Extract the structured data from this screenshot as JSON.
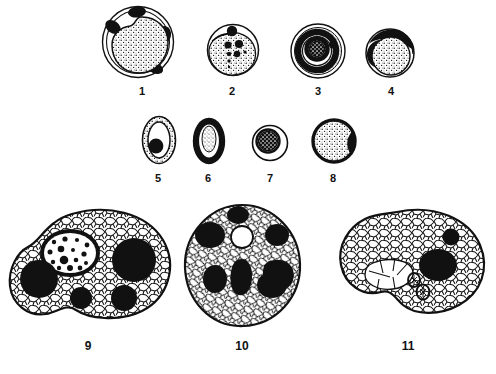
{
  "plate": {
    "background_color": "#ffffff",
    "ink_color": "#000000",
    "width": 496,
    "height": 374,
    "description": "Black and white line-drawing plate of eleven numbered protozoan cyst and trophozoite specimens arranged in three rows",
    "rows": [
      {
        "name": "row-1",
        "figure_numbers": [
          "1",
          "2",
          "3",
          "4"
        ]
      },
      {
        "name": "row-2",
        "figure_numbers": [
          "5",
          "6",
          "7",
          "8"
        ]
      },
      {
        "name": "row-3",
        "figure_numbers": [
          "9",
          "10",
          "11"
        ]
      }
    ]
  },
  "figures": [
    {
      "id": "figure-1",
      "label": "1",
      "row": 1,
      "shape": "large round cyst",
      "outline": "double circular wall",
      "interior": "large stippled rounded mass offset within the wall",
      "inclusions": "four irregular solid black chromatoid patches around the periphery",
      "label_x": 142,
      "label_y": 85
    },
    {
      "id": "figure-2",
      "label": "2",
      "row": 1,
      "shape": "round cyst",
      "outline": "thin circular wall",
      "interior": "stippled granular mass filling most of the cyst",
      "inclusions": "one large black body at top and a cluster of seven graded black dots in the centre",
      "label_x": 232,
      "label_y": 85
    },
    {
      "id": "figure-3",
      "label": "3",
      "row": 1,
      "shape": "round cyst with concentric zones",
      "outline": "thin circular wall",
      "interior": "thick solid black ring enclosing a white ring",
      "inclusions": "dark coarsely stippled central nucleus",
      "label_x": 318,
      "label_y": 85
    },
    {
      "id": "figure-4",
      "label": "4",
      "row": 1,
      "shape": "round cyst",
      "outline": "thin circular wall",
      "interior": "stippled rounded mass filling the lower two thirds",
      "inclusions": "solid black crescent on the upper left and a dark band along the top right",
      "label_x": 391,
      "label_y": 85
    },
    {
      "id": "figure-5",
      "label": "5",
      "row": 2,
      "shape": "oval cyst",
      "outline": "thick stippled oval wall",
      "interior": "clear white oval lumen",
      "inclusions": "one solid black round body set in the lower left of the lumen",
      "label_x": 158,
      "label_y": 173
    },
    {
      "id": "figure-6",
      "label": "6",
      "row": 2,
      "shape": "oval cyst",
      "outline": "thick solid dark oval wall",
      "interior": "pale stippled lens shaped mass",
      "inclusions": "none distinct",
      "label_x": 208,
      "label_y": 173
    },
    {
      "id": "figure-7",
      "label": "7",
      "row": 2,
      "shape": "small round cyst",
      "outline": "thin circular wall",
      "interior": "clear narrow white zone",
      "inclusions": "dark coarsely textured central nucleus",
      "label_x": 270,
      "label_y": 173
    },
    {
      "id": "figure-8",
      "label": "8",
      "row": 2,
      "shape": "round cyst",
      "outline": "thick solid black circular wall",
      "interior": "finely stippled mass",
      "inclusions": "a notch of heavier black at the right edge",
      "label_x": 333,
      "label_y": 173
    },
    {
      "id": "figure-9",
      "label": "9",
      "row": 3,
      "shape": "large irregular amoeboid trophozoite",
      "outline": "lobed pseudopod bearing margin",
      "interior": "coarsely reticulated vacuolated cytoplasm",
      "inclusions": "one ringed nucleus with many chromatin dots, one large black vacuole at right, one black vacuole at left, two smaller black vacuoles below",
      "label_x": 88,
      "label_y": 341
    },
    {
      "id": "figure-10",
      "label": "10",
      "row": 3,
      "shape": "rounded trophozoite",
      "outline": "nearly circular margin",
      "interior": "coarsely reticulated vacuolated cytoplasm",
      "inclusions": "seven solid black ingested bodies of graded size and one clear white vacuole near the top centre",
      "label_x": 242,
      "label_y": 341
    },
    {
      "id": "figure-11",
      "label": "11",
      "row": 3,
      "shape": "large kidney shaped trophozoite",
      "outline": "smooth bean shaped margin with a notch at lower right",
      "interior": "coarsely reticulated vacuolated cytoplasm with a pale clear zone at the left centre",
      "inclusions": "one small black body upper right, one large black nucleus right of centre, two small ringed ingested corpuscles at centre",
      "label_x": 408,
      "label_y": 341
    }
  ]
}
